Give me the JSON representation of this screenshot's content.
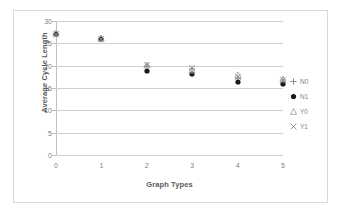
{
  "chart_data": {
    "type": "scatter",
    "title": "",
    "xlabel": "Graph Types",
    "ylabel": "Average Cycle Length",
    "x": [
      0,
      1,
      2,
      3,
      4,
      5
    ],
    "xlim": [
      0,
      5
    ],
    "ylim": [
      0,
      30
    ],
    "xticks": [
      "0",
      "1",
      "2",
      "3",
      "4",
      "5"
    ],
    "yticks": [
      "0",
      "5",
      "10",
      "15",
      "20",
      "25",
      "30"
    ],
    "ytick_values": [
      0,
      5,
      10,
      15,
      20,
      25,
      30
    ],
    "grid": "horizontal",
    "legend_position": "right",
    "series": [
      {
        "name": "N0",
        "marker": "plus",
        "color": "#808080",
        "values": [
          27.2,
          26.0,
          20.0,
          19.2,
          17.2,
          16.8
        ]
      },
      {
        "name": "N1",
        "marker": "circle",
        "color": "#1a1a1a",
        "values": [
          27.0,
          25.9,
          18.8,
          18.2,
          16.3,
          15.8
        ]
      },
      {
        "name": "Y0",
        "marker": "triangle",
        "color": "#a6a6a6",
        "values": [
          27.3,
          26.1,
          20.2,
          19.0,
          17.8,
          17.0
        ]
      },
      {
        "name": "Y1",
        "marker": "cross",
        "color": "#8c8c8c",
        "values": [
          27.1,
          26.0,
          20.1,
          19.4,
          17.4,
          16.9
        ]
      }
    ]
  },
  "legend": {
    "entries": [
      {
        "label": "N0",
        "marker": "plus-marker-icon"
      },
      {
        "label": "N1",
        "marker": "filled-circle-marker-icon"
      },
      {
        "label": "Y0",
        "marker": "triangle-marker-icon"
      },
      {
        "label": "Y1",
        "marker": "cross-marker-icon"
      }
    ]
  }
}
